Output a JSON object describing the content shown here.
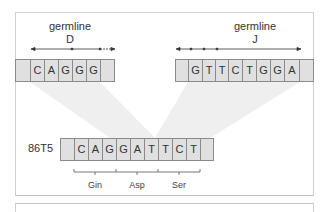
{
  "diagram": {
    "d_segment": {
      "title_line1": "germline",
      "title_line2": "D",
      "cells": [
        "",
        "C",
        "A",
        "G",
        "G",
        "G",
        ""
      ]
    },
    "j_segment": {
      "title_line1": "germline",
      "title_line2": "J",
      "cells": [
        "",
        "G",
        "T",
        "T",
        "C",
        "T",
        "G",
        "G",
        "A",
        ""
      ]
    },
    "recombined": {
      "label": "86T5",
      "cells": [
        "",
        "C",
        "A",
        "G",
        "G",
        "A",
        "T",
        "T",
        "C",
        "T",
        ""
      ]
    },
    "codons": [
      {
        "label": "Gin"
      },
      {
        "label": "Asp"
      },
      {
        "label": "Ser"
      }
    ],
    "colors": {
      "cell_fill": "#e0e0e0",
      "cell_border": "#8a8a8a",
      "projection_fill": "#efefef",
      "text": "#333333"
    }
  }
}
